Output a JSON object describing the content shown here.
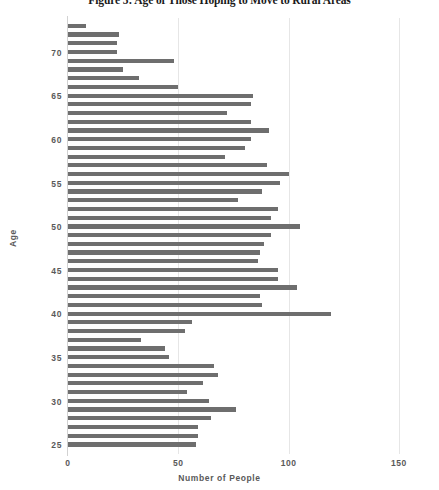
{
  "chart_data": {
    "type": "bar",
    "orientation": "horizontal",
    "title": "Figure 5: Age of Those Hoping to Move to Rural Areas",
    "xlabel": "Number of People",
    "ylabel": "Age",
    "xlim": [
      0,
      155
    ],
    "ylim": [
      24,
      74
    ],
    "xticks": [
      0,
      50,
      100,
      150
    ],
    "yticks": [
      25,
      30,
      35,
      40,
      45,
      50,
      55,
      60,
      65,
      70
    ],
    "grid": "vertical",
    "legend": "none",
    "bar_color": "#6e6e6e",
    "categories": [
      73,
      72,
      71,
      70,
      69,
      68,
      67,
      66,
      65,
      64,
      63,
      62,
      61,
      60,
      59,
      58,
      57,
      56,
      55,
      54,
      53,
      52,
      51,
      50,
      49,
      48,
      47,
      46,
      45,
      44,
      43,
      42,
      41,
      40,
      39,
      38,
      37,
      36,
      35,
      34,
      33,
      32,
      31,
      30,
      29,
      28,
      27,
      26,
      25
    ],
    "values": [
      8,
      23,
      22,
      22,
      48,
      25,
      32,
      50,
      84,
      83,
      72,
      83,
      91,
      83,
      80,
      71,
      90,
      100,
      96,
      88,
      77,
      95,
      92,
      105,
      92,
      89,
      87,
      86,
      95,
      95,
      104,
      87,
      88,
      119,
      56,
      53,
      33,
      44,
      46,
      66,
      68,
      61,
      54,
      64,
      76,
      65,
      59,
      59,
      58
    ],
    "data_points": [
      {
        "age": 73,
        "people": 8
      },
      {
        "age": 72,
        "people": 23
      },
      {
        "age": 71,
        "people": 22
      },
      {
        "age": 70,
        "people": 22
      },
      {
        "age": 69,
        "people": 48
      },
      {
        "age": 68,
        "people": 25
      },
      {
        "age": 67,
        "people": 32
      },
      {
        "age": 66,
        "people": 50
      },
      {
        "age": 65,
        "people": 84
      },
      {
        "age": 64,
        "people": 83
      },
      {
        "age": 63,
        "people": 72
      },
      {
        "age": 62,
        "people": 83
      },
      {
        "age": 61,
        "people": 91
      },
      {
        "age": 60,
        "people": 83
      },
      {
        "age": 59,
        "people": 80
      },
      {
        "age": 58,
        "people": 71
      },
      {
        "age": 57,
        "people": 90
      },
      {
        "age": 56,
        "people": 100
      },
      {
        "age": 55,
        "people": 96
      },
      {
        "age": 54,
        "people": 88
      },
      {
        "age": 53,
        "people": 77
      },
      {
        "age": 52,
        "people": 95
      },
      {
        "age": 51,
        "people": 92
      },
      {
        "age": 50,
        "people": 105
      },
      {
        "age": 49,
        "people": 92
      },
      {
        "age": 48,
        "people": 89
      },
      {
        "age": 47,
        "people": 87
      },
      {
        "age": 46,
        "people": 86
      },
      {
        "age": 45,
        "people": 95
      },
      {
        "age": 44,
        "people": 95
      },
      {
        "age": 43,
        "people": 104
      },
      {
        "age": 42,
        "people": 87
      },
      {
        "age": 41,
        "people": 88
      },
      {
        "age": 40,
        "people": 119
      },
      {
        "age": 39,
        "people": 56
      },
      {
        "age": 38,
        "people": 53
      },
      {
        "age": 37,
        "people": 33
      },
      {
        "age": 36,
        "people": 44
      },
      {
        "age": 35,
        "people": 46
      },
      {
        "age": 34,
        "people": 66
      },
      {
        "age": 33,
        "people": 68
      },
      {
        "age": 32,
        "people": 61
      },
      {
        "age": 31,
        "people": 54
      },
      {
        "age": 30,
        "people": 64
      },
      {
        "age": 29,
        "people": 76
      },
      {
        "age": 28,
        "people": 65
      },
      {
        "age": 27,
        "people": 59
      },
      {
        "age": 26,
        "people": 59
      },
      {
        "age": 25,
        "people": 58
      }
    ]
  }
}
